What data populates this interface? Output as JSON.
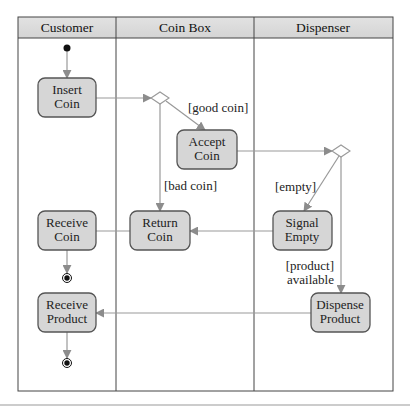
{
  "diagram": {
    "type": "uml-activity-diagram",
    "colors": {
      "header_fill": "#dcdcdc",
      "action_fill": "#d6d6d6",
      "action_stroke": "#555555",
      "arrow": "#909090",
      "frame": "#444444"
    },
    "swimlanes": [
      {
        "id": "customer",
        "label": "Customer"
      },
      {
        "id": "coinbox",
        "label": "Coin Box"
      },
      {
        "id": "dispenser",
        "label": "Dispenser"
      }
    ],
    "actions": {
      "insert_coin": {
        "line1": "Insert",
        "line2": "Coin",
        "lane": "Customer"
      },
      "accept_coin": {
        "line1": "Accept",
        "line2": "Coin",
        "lane": "Coin Box"
      },
      "return_coin": {
        "line1": "Return",
        "line2": "Coin",
        "lane": "Coin Box"
      },
      "receive_coin": {
        "line1": "Receive",
        "line2": "Coin",
        "lane": "Customer"
      },
      "signal_empty": {
        "line1": "Signal",
        "line2": "Empty",
        "lane": "Dispenser"
      },
      "dispense_product": {
        "line1": "Dispense",
        "line2": "Product",
        "lane": "Dispenser"
      },
      "receive_product": {
        "line1": "Receive",
        "line2": "Product",
        "lane": "Customer"
      }
    },
    "guards": {
      "good_coin": "[good coin]",
      "bad_coin": "[bad coin]",
      "empty": "[empty]",
      "product_line1": "[product]",
      "product_line2": "available"
    },
    "flows": [
      {
        "from": "initial",
        "to": "Insert Coin"
      },
      {
        "from": "Insert Coin",
        "to": "decision-1"
      },
      {
        "from": "decision-1",
        "to": "Accept Coin",
        "guard": "[good coin]"
      },
      {
        "from": "decision-1",
        "to": "Return Coin",
        "guard": "[bad coin]"
      },
      {
        "from": "Accept Coin",
        "to": "decision-2"
      },
      {
        "from": "decision-2",
        "to": "Signal Empty",
        "guard": "[empty]"
      },
      {
        "from": "decision-2",
        "to": "Dispense Product",
        "guard": "[product] available"
      },
      {
        "from": "Signal Empty",
        "to": "Return Coin"
      },
      {
        "from": "Return Coin",
        "to": "Receive Coin"
      },
      {
        "from": "Receive Coin",
        "to": "final-1"
      },
      {
        "from": "Dispense Product",
        "to": "Receive Product"
      },
      {
        "from": "Receive Product",
        "to": "final-2"
      }
    ]
  }
}
